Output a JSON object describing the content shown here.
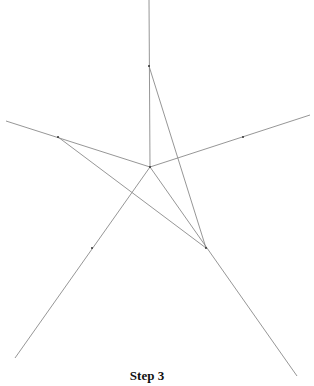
{
  "caption": "Step 3",
  "colors": {
    "line": "#8a8a8a",
    "vertex": "#333333",
    "text": "#111111"
  },
  "center": [
    150,
    167
  ],
  "rays": [
    {
      "name": "ray-up",
      "to": [
        149,
        0
      ]
    },
    {
      "name": "ray-left",
      "to": [
        6,
        121
      ]
    },
    {
      "name": "ray-right",
      "to": [
        310,
        115
      ]
    },
    {
      "name": "ray-lower-left",
      "to": [
        15,
        358
      ]
    },
    {
      "name": "ray-lower-right",
      "to": [
        297,
        376
      ]
    }
  ],
  "star_vertices": {
    "top": [
      149,
      66
    ],
    "left": [
      58,
      137
    ],
    "bottom_right": [
      206,
      248
    ]
  },
  "tick_marks": [
    [
      243,
      137
    ],
    [
      92,
      248
    ]
  ]
}
